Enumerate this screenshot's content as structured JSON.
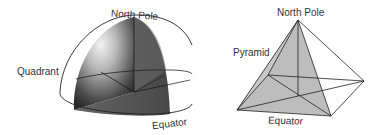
{
  "left_figure": {
    "title": "Hemisphere quadrant",
    "labels": {
      "north_pole": "North Pole",
      "quadrant": "Quadrant",
      "equator": "Equator"
    }
  },
  "right_figure": {
    "title": "Pyramid",
    "labels": {
      "north_pole": "North Pole",
      "pyramid": "Pyramid",
      "equator": "Equator"
    }
  },
  "colors": {
    "line": "#222222",
    "pyramid_fill": "#bdbdbd",
    "quadrant_dark": "#3a3a3a",
    "quadrant_light": "#e8e8e8"
  }
}
